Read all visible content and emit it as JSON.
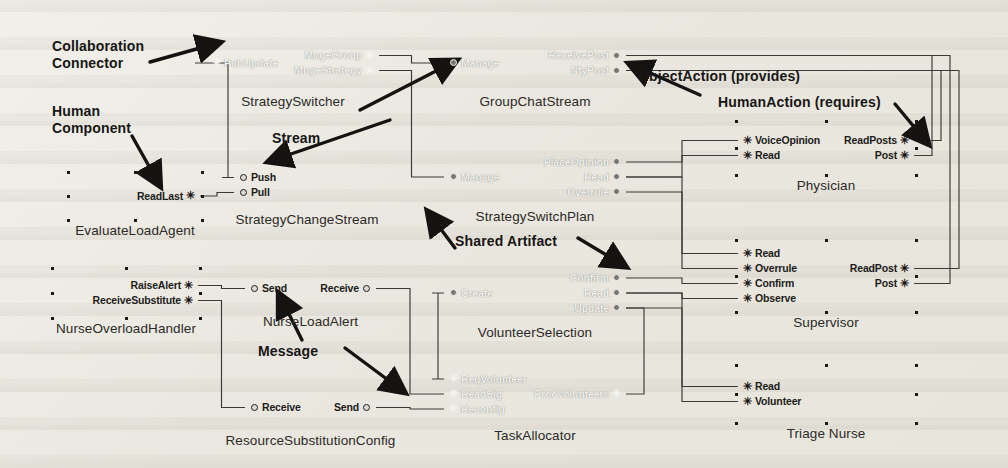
{
  "diagram": {
    "glyphs": {
      "provides_icon": "ball-port-icon",
      "requires_icon": "human-action-icon",
      "requires_char": "✳"
    },
    "colors": {
      "agent_fill": "#7e7b74",
      "artifact_fill": "#9c9992",
      "component_fill": "#d4d1c9",
      "line": "#3a3834",
      "text": "#1d1c1a",
      "page": "#eceae4"
    },
    "annotations": [
      {
        "id": "collaboration-connector",
        "text": "Collaboration\nConnector",
        "x": 52,
        "y": 38
      },
      {
        "id": "human-component",
        "text": "Human\nComponent",
        "x": 52,
        "y": 103
      },
      {
        "id": "stream",
        "text": "Stream",
        "x": 272,
        "y": 130
      },
      {
        "id": "object-action",
        "text": "ObjectAction (provides)",
        "x": 638,
        "y": 68
      },
      {
        "id": "human-action",
        "text": "HumanAction (requires)",
        "x": 718,
        "y": 94
      },
      {
        "id": "shared-artifact",
        "text": "Shared Artifact",
        "x": 455,
        "y": 233
      },
      {
        "id": "message",
        "text": "Message",
        "x": 258,
        "y": 343
      }
    ],
    "nodes": [
      {
        "id": "strategy-switcher",
        "name": "StrategySwitcher",
        "kind": "agent",
        "tone": "dark",
        "x": 205,
        "y": 35,
        "w": 176,
        "h": 56,
        "left": [
          {
            "label": "PubUpdate",
            "glyph": "requires"
          }
        ],
        "right": [
          {
            "label": "MngeGroup",
            "glyph": "requires"
          },
          {
            "label": "MngeStrategy",
            "glyph": "requires"
          }
        ]
      },
      {
        "id": "group-chat-stream",
        "name": "GroupChatStream",
        "kind": "artifact",
        "tone": "dark",
        "x": 442,
        "y": 35,
        "w": 186,
        "h": 56,
        "left": [
          {
            "label": "Manage",
            "glyph": "provides"
          }
        ],
        "right": [
          {
            "label": "ReceivePost",
            "glyph": "provides"
          },
          {
            "label": "NfyPost",
            "glyph": "provides"
          }
        ]
      },
      {
        "id": "evaluate-load-agent",
        "name": "EvaluateLoadAgent",
        "kind": "human",
        "tone": "light",
        "x": 68,
        "y": 172,
        "w": 134,
        "h": 48,
        "left": [],
        "right": [
          {
            "label": "ReadLast",
            "glyph": "requires"
          }
        ]
      },
      {
        "id": "strategy-change-stream",
        "name": "StrategyChangeStream",
        "kind": "stream",
        "tone": "light",
        "x": 232,
        "y": 161,
        "w": 150,
        "h": 48,
        "left": [
          {
            "label": "Push",
            "glyph": "provides"
          },
          {
            "label": "Pull",
            "glyph": "provides"
          }
        ],
        "right": []
      },
      {
        "id": "strategy-switch-plan",
        "name": "StrategySwitchPlan",
        "kind": "artifact",
        "tone": "dark",
        "x": 442,
        "y": 148,
        "w": 186,
        "h": 58,
        "left": [
          {
            "label": "Manage",
            "glyph": "provides"
          }
        ],
        "right": [
          {
            "label": "PlaceOpinion",
            "glyph": "provides"
          },
          {
            "label": "Read",
            "glyph": "provides"
          },
          {
            "label": "Overrule",
            "glyph": "provides"
          }
        ]
      },
      {
        "id": "physician",
        "name": "Physician",
        "kind": "human",
        "tone": "light",
        "x": 736,
        "y": 121,
        "w": 180,
        "h": 54,
        "left": [
          {
            "label": "VoiceOpinion",
            "glyph": "requires"
          },
          {
            "label": "Read",
            "glyph": "requires"
          }
        ],
        "right": [
          {
            "label": "ReadPosts",
            "glyph": "requires"
          },
          {
            "label": "Post",
            "glyph": "requires"
          }
        ]
      },
      {
        "id": "nurse-overload-handler",
        "name": "NurseOverloadHandler",
        "kind": "human",
        "tone": "light",
        "x": 52,
        "y": 268,
        "w": 148,
        "h": 50,
        "left": [],
        "right": [
          {
            "label": "RaiseAlert",
            "glyph": "requires"
          },
          {
            "label": "ReceiveSubstitute",
            "glyph": "requires"
          }
        ]
      },
      {
        "id": "nurse-load-alert",
        "name": "NurseLoadAlert",
        "kind": "message",
        "tone": "light",
        "x": 243,
        "y": 266,
        "w": 135,
        "h": 45,
        "left": [
          {
            "label": "Send",
            "glyph": "provides"
          }
        ],
        "right": [
          {
            "label": "Receive",
            "glyph": "provides"
          }
        ]
      },
      {
        "id": "volunteer-selection",
        "name": "VolunteerSelection",
        "kind": "artifact",
        "tone": "dark",
        "x": 442,
        "y": 264,
        "w": 186,
        "h": 58,
        "left": [
          {
            "label": "Create",
            "glyph": "provides"
          }
        ],
        "right": [
          {
            "label": "Confirm",
            "glyph": "provides"
          },
          {
            "label": "Read",
            "glyph": "provides"
          },
          {
            "label": "Update",
            "glyph": "provides"
          }
        ]
      },
      {
        "id": "supervisor",
        "name": "Supervisor",
        "kind": "human",
        "tone": "light",
        "x": 736,
        "y": 240,
        "w": 180,
        "h": 72,
        "left": [
          {
            "label": "Read",
            "glyph": "requires"
          },
          {
            "label": "Overrule",
            "glyph": "requires"
          },
          {
            "label": "Confirm",
            "glyph": "requires"
          },
          {
            "label": "Observe",
            "glyph": "requires"
          }
        ],
        "right": [
          {
            "label": "ReadPost",
            "glyph": "requires"
          },
          {
            "label": "Post",
            "glyph": "requires"
          }
        ]
      },
      {
        "id": "resource-substitution-config",
        "name": "ResourceSubstitutionConfig",
        "kind": "message",
        "tone": "light",
        "x": 243,
        "y": 385,
        "w": 135,
        "h": 45,
        "left": [
          {
            "label": "Receive",
            "glyph": "provides"
          }
        ],
        "right": [
          {
            "label": "Send",
            "glyph": "provides"
          }
        ]
      },
      {
        "id": "task-allocator",
        "name": "TaskAllocator",
        "kind": "agent",
        "tone": "dark",
        "x": 442,
        "y": 363,
        "w": 186,
        "h": 62,
        "left": [
          {
            "label": "ReqVolunteer",
            "glyph": "requires"
          },
          {
            "label": "ReadSig",
            "glyph": "requires"
          },
          {
            "label": "Reconfig",
            "glyph": "requires"
          }
        ],
        "right": [
          {
            "label": "ProcVolunteers",
            "glyph": "requires"
          }
        ]
      },
      {
        "id": "triage-nurse",
        "name": "Triage Nurse",
        "kind": "human",
        "tone": "light",
        "x": 736,
        "y": 365,
        "w": 180,
        "h": 58,
        "left": [
          {
            "label": "Read",
            "glyph": "requires"
          },
          {
            "label": "Volunteer",
            "glyph": "requires"
          }
        ],
        "right": []
      }
    ],
    "connections": [
      {
        "from": "strategy-switcher.MngeGroup",
        "to": "group-chat-stream.Manage"
      },
      {
        "from": "strategy-switcher.MngeStrategy",
        "to": "strategy-switch-plan.Manage"
      },
      {
        "from": "strategy-switcher.PubUpdate",
        "to": "strategy-change-stream.Push"
      },
      {
        "from": "evaluate-load-agent.ReadLast",
        "to": "strategy-change-stream.Pull"
      },
      {
        "from": "group-chat-stream.ReceivePost",
        "to": "physician.Post"
      },
      {
        "from": "group-chat-stream.NfyPost",
        "to": "physician.ReadPosts"
      },
      {
        "from": "group-chat-stream.ReceivePost",
        "to": "supervisor.Post"
      },
      {
        "from": "group-chat-stream.NfyPost",
        "to": "supervisor.ReadPost"
      },
      {
        "from": "strategy-switch-plan.PlaceOpinion",
        "to": "physician.VoiceOpinion"
      },
      {
        "from": "strategy-switch-plan.Read",
        "to": "physician.Read"
      },
      {
        "from": "strategy-switch-plan.Read",
        "to": "supervisor.Read"
      },
      {
        "from": "strategy-switch-plan.Overrule",
        "to": "supervisor.Overrule"
      },
      {
        "from": "nurse-overload-handler.RaiseAlert",
        "to": "nurse-load-alert.Send"
      },
      {
        "from": "nurse-overload-handler.ReceiveSubstitute",
        "to": "resource-substitution-config.Receive"
      },
      {
        "from": "nurse-load-alert.Receive",
        "to": "task-allocator.ReadSig"
      },
      {
        "from": "resource-substitution-config.Send",
        "to": "task-allocator.Reconfig"
      },
      {
        "from": "volunteer-selection.Create",
        "to": "task-allocator.ReqVolunteer"
      },
      {
        "from": "volunteer-selection.Confirm",
        "to": "supervisor.Confirm"
      },
      {
        "from": "volunteer-selection.Read",
        "to": "supervisor.Observe"
      },
      {
        "from": "volunteer-selection.Read",
        "to": "triage-nurse.Read"
      },
      {
        "from": "volunteer-selection.Update",
        "to": "triage-nurse.Volunteer"
      },
      {
        "from": "task-allocator.ProcVolunteers",
        "to": "volunteer-selection.Update"
      }
    ]
  }
}
